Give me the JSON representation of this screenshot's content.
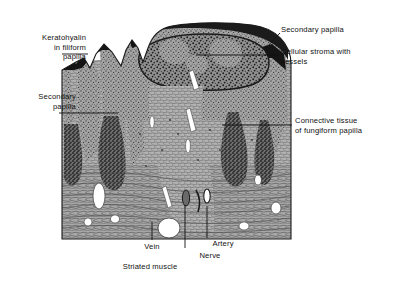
{
  "figure": {
    "type": "histology-illustration",
    "background_color": "#ffffff",
    "ink_color": "#111111",
    "tissue": {
      "epithelium_tone": "#8e8e8e",
      "keratin_tone": "#1d1d1d",
      "stroma_tone": "#a9a9a9",
      "submucosa_tone": "#9c9c9c",
      "lumen_color": "#ffffff",
      "bounds": {
        "left": 62,
        "top": 24,
        "right": 291,
        "bottom": 239
      }
    }
  },
  "labels": [
    {
      "name": "keratohyalin-in-filiform-papilla",
      "lines": [
        "Keratohyalin",
        "in filiform",
        "papilla"
      ],
      "text": "Keratohyalin\nin filiform\npapilla",
      "align": "right",
      "x": 8,
      "y": 33,
      "width": 78
    },
    {
      "name": "secondary-papilla-left",
      "lines": [
        "Secondary",
        "papilla"
      ],
      "text": "Secondary\npapilla",
      "align": "right",
      "x": 4,
      "y": 92,
      "width": 72
    },
    {
      "name": "secondary-papilla-right",
      "lines": [
        "Secondary papilla"
      ],
      "text": "Secondary papilla",
      "align": "left",
      "x": 281,
      "y": 25,
      "width": 120
    },
    {
      "name": "cellular-stroma-with-vessels",
      "lines": [
        "Cellular stroma with",
        "vessels"
      ],
      "text": "Cellular stroma with\nvessels",
      "align": "left",
      "x": 281,
      "y": 47,
      "width": 122,
      "second_line_indent": 29
    },
    {
      "name": "connective-tissue-of-fungiform-papilla",
      "lines": [
        "Connective tissue",
        "of fungiform papilla"
      ],
      "text": "Connective tissue\nof fungiform papilla",
      "align": "left",
      "x": 295,
      "y": 116,
      "width": 108
    },
    {
      "name": "vein",
      "lines": [
        "Vein"
      ],
      "text": "Vein",
      "align": "center",
      "x": 133,
      "y": 242,
      "width": 38
    },
    {
      "name": "artery",
      "lines": [
        "Artery"
      ],
      "text": "Artery",
      "align": "center",
      "x": 203,
      "y": 239,
      "width": 40
    },
    {
      "name": "nerve",
      "lines": [
        "Nerve"
      ],
      "text": "Nerve",
      "align": "center",
      "x": 190,
      "y": 251,
      "width": 40
    },
    {
      "name": "striated-muscle",
      "lines": [
        "Striated muscle"
      ],
      "text": "Striated muscle",
      "align": "center",
      "x": 104,
      "y": 262,
      "width": 92
    }
  ],
  "leaders": [
    {
      "name": "leader-keratohyalin",
      "from": [
        62,
        54
      ],
      "to": [
        88,
        54
      ]
    },
    {
      "name": "leader-secondary-papilla-left",
      "from": [
        59,
        113
      ],
      "to": [
        118,
        113
      ]
    },
    {
      "name": "leader-secondary-papilla-right",
      "from": [
        280,
        33
      ],
      "to": [
        266,
        48
      ]
    },
    {
      "name": "leader-cellular-stroma",
      "from": [
        279,
        55
      ],
      "to": [
        196,
        55
      ]
    },
    {
      "name": "leader-connective-tissue",
      "from": [
        292,
        125
      ],
      "to": [
        222,
        125
      ]
    },
    {
      "name": "leader-vein",
      "from": [
        152,
        240
      ],
      "to": [
        152,
        222
      ]
    },
    {
      "name": "leader-artery",
      "from": [
        207,
        238
      ],
      "to": [
        207,
        206
      ]
    },
    {
      "name": "leader-nerve",
      "from": [
        185,
        248
      ],
      "to": [
        185,
        205
      ]
    }
  ]
}
